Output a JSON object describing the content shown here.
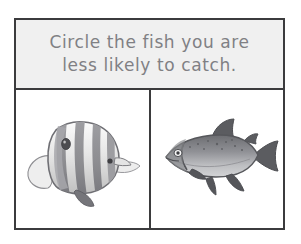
{
  "worksheet": {
    "prompt": {
      "line1": "Circle the fish you are",
      "line2": "less likely to catch.",
      "full_text": "Circle the fish you are\nless likely to catch.",
      "text_color": "#808084",
      "band_background": "#f0f0f0"
    },
    "border_color": "#3b3b3d",
    "panel_background": "#ffffff",
    "choices": [
      {
        "id": "left",
        "position": "left",
        "icon_name": "butterflyfish-illustration",
        "label": "Butterflyfish",
        "description": "Striped tropical butterflyfish facing right with tall rounded body, vertical dark bands, dorsal eye spot near tail and pointed snout",
        "orientation": "facing-right",
        "colors": {
          "body_light": "#f2f2f2",
          "body_mid": "#c9c9c9",
          "stripe": "#8d8d90",
          "stripe_dark": "#6e6e72",
          "outline": "#6a6a6e",
          "eye": "#4a4a4e"
        }
      },
      {
        "id": "right",
        "position": "right",
        "icon_name": "trout-illustration",
        "label": "Trout",
        "description": "Speckled trout or salmon facing left with dark grey back, pale belly, dark forked tail and dark fins",
        "orientation": "facing-left",
        "colors": {
          "back": "#6f7074",
          "body_mid": "#9a9b9e",
          "belly": "#c8c9cb",
          "fin_dark": "#5c5d61",
          "outline": "#57585c",
          "eye": "#ffffff"
        }
      }
    ]
  }
}
